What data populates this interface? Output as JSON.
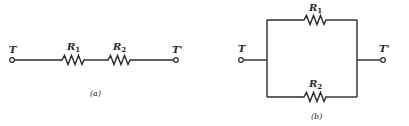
{
  "diagram_a": {
    "caption": "(a)",
    "type": "series circuit",
    "terminal_left": "T",
    "terminal_right": "T'",
    "resistors": [
      {
        "label": "R",
        "subscript": "1"
      },
      {
        "label": "R",
        "subscript": "2"
      }
    ]
  },
  "diagram_b": {
    "caption": "(b)",
    "type": "parallel circuit",
    "terminal_left": "T",
    "terminal_right": "T'",
    "resistors": [
      {
        "label": "R",
        "subscript": "1"
      },
      {
        "label": "R",
        "subscript": "2"
      }
    ]
  },
  "colors": {
    "line": "#2a2a2a",
    "background": "#ffffff"
  }
}
